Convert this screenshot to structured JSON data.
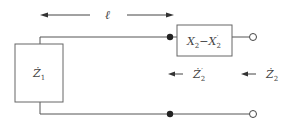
{
  "diagram": {
    "title": "",
    "length_label": "ℓ",
    "load_box": {
      "label_main": "Ż",
      "label_sub": "1"
    },
    "series_box": {
      "label_x2": "X",
      "label_x2_sub": "2",
      "label_minus": "−",
      "label_x2p": "X",
      "label_x2p_sub": "2",
      "label_x2p_prime": "′"
    },
    "impedance_labels": [
      {
        "main": "Ż",
        "sub": "2",
        "prime": "′"
      },
      {
        "main": "Ż",
        "sub": "2",
        "prime": ""
      }
    ],
    "colors": {
      "wire": "#555555",
      "box_stroke": "#666666",
      "text": "#444444",
      "dot": "#222222"
    }
  }
}
